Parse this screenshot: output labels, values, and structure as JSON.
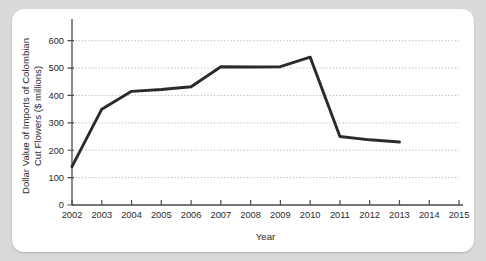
{
  "chart_data": {
    "type": "line",
    "title": "",
    "xlabel": "Year",
    "ylabel": "Dollar Value of Imports of Colombian Cut Flowers ($ millions)",
    "ylabel_line1": "Dollar Value of Imports of Colombian",
    "ylabel_line2": "Cut Flowers ($ millions)",
    "x": [
      2002,
      2003,
      2004,
      2005,
      2006,
      2007,
      2008,
      2009,
      2010,
      2011,
      2012,
      2013
    ],
    "values": [
      140,
      350,
      415,
      422,
      432,
      505,
      504,
      505,
      540,
      250,
      238,
      230
    ],
    "series": [
      {
        "name": "Imports of Colombian Cut Flowers",
        "values": [
          140,
          350,
          415,
          422,
          432,
          505,
          504,
          505,
          540,
          250,
          238,
          230
        ]
      }
    ],
    "xticks": [
      "2002",
      "2003",
      "2004",
      "2005",
      "2006",
      "2007",
      "2008",
      "2009",
      "2010",
      "2011",
      "2012",
      "2013",
      "2014",
      "2015"
    ],
    "xtick_values": [
      2002,
      2003,
      2004,
      2005,
      2006,
      2007,
      2008,
      2009,
      2010,
      2011,
      2012,
      2013,
      2014,
      2015
    ],
    "yticks": [
      "0",
      "100",
      "200",
      "300",
      "400",
      "500",
      "600"
    ],
    "ytick_values": [
      0,
      100,
      200,
      300,
      400,
      500,
      600
    ],
    "xlim": [
      2002,
      2015
    ],
    "ylim": [
      0,
      650
    ],
    "grid": true,
    "grid_axis": "y",
    "legend": false,
    "legend_position": "none",
    "line_color": "#2b2b2b",
    "grid_color": "#b5b5b5",
    "axis_color": "#4a4a4a",
    "background_color": "#ffffff",
    "page_background_color": "#d9d9d9"
  }
}
